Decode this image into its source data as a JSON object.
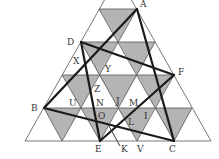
{
  "diagram": {
    "colors": {
      "background": "#ffffff",
      "shade": "#b4b4b4",
      "grid_line": "#555555",
      "thick_line": "#1a1a1a"
    },
    "points": {
      "A": {
        "label": "A",
        "x": 137,
        "y": 9,
        "lx": 140,
        "ly": 7
      },
      "D": {
        "label": "D",
        "x": 81,
        "y": 42,
        "lx": 67,
        "ly": 45
      },
      "F": {
        "label": "F",
        "x": 174,
        "y": 75,
        "lx": 178,
        "ly": 75
      },
      "B": {
        "label": "B",
        "x": 44,
        "y": 108,
        "lx": 31,
        "ly": 111
      },
      "E": {
        "label": "E",
        "x": 100,
        "y": 141,
        "lx": 95,
        "ly": 152
      },
      "C": {
        "label": "C",
        "x": 174,
        "y": 141,
        "lx": 169,
        "ly": 152
      }
    },
    "labels": [
      {
        "text": "A",
        "x": 140,
        "y": 7
      },
      {
        "text": "D",
        "x": 67,
        "y": 45
      },
      {
        "text": "X",
        "x": 73,
        "y": 64
      },
      {
        "text": "Y",
        "x": 105,
        "y": 72
      },
      {
        "text": "F",
        "x": 178,
        "y": 75
      },
      {
        "text": "Z",
        "x": 94,
        "y": 92
      },
      {
        "text": "B",
        "x": 31,
        "y": 111
      },
      {
        "text": "U",
        "x": 69,
        "y": 106
      },
      {
        "text": "N",
        "x": 96,
        "y": 106
      },
      {
        "text": "J",
        "x": 116,
        "y": 104
      },
      {
        "text": "M",
        "x": 129,
        "y": 106
      },
      {
        "text": "O",
        "x": 98,
        "y": 119
      },
      {
        "text": "L",
        "x": 128,
        "y": 125
      },
      {
        "text": "I",
        "x": 144,
        "y": 119
      },
      {
        "text": "E",
        "x": 95,
        "y": 152
      },
      {
        "text": "K",
        "x": 121,
        "y": 152
      },
      {
        "text": "V",
        "x": 137,
        "y": 152
      },
      {
        "text": "C",
        "x": 169,
        "y": 152
      }
    ],
    "thick_segments": [
      [
        "A",
        "B"
      ],
      [
        "A",
        "C"
      ],
      [
        "D",
        "F"
      ],
      [
        "D",
        "E"
      ],
      [
        "E",
        "F"
      ],
      [
        "B",
        "C"
      ]
    ]
  }
}
